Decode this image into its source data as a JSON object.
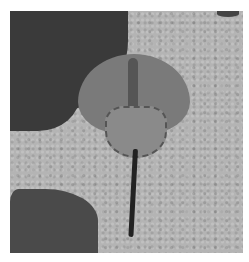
{
  "image": {
    "subject": "horseshoe crab on sand",
    "description": "Grayscale photograph of a horseshoe crab resting on speckled sand with dark rocks at top-left and bottom-left",
    "colors": {
      "sand": "#b4b4b4",
      "rock": "#3a3a3a",
      "shell": "#7a7a7a",
      "tail": "#222222",
      "border": "#ffffff"
    }
  }
}
